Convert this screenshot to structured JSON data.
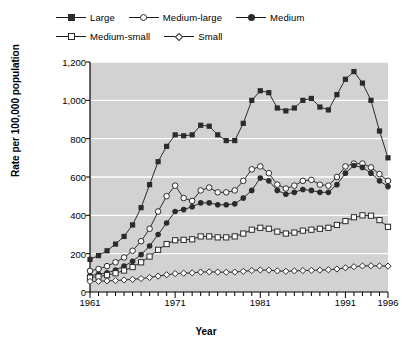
{
  "chart_data": {
    "type": "line",
    "title": "",
    "subtitle": "",
    "xlabel": "Year",
    "ylabel": "Rate per 100,000 population",
    "xlim": [
      1961,
      1996
    ],
    "ylim": [
      0,
      1200
    ],
    "yticks": [
      0,
      200,
      400,
      600,
      800,
      1000,
      1200
    ],
    "ytick_labels": [
      "0",
      "200",
      "400",
      "600",
      "800",
      "1,000",
      "1,200"
    ],
    "xticks": [
      1961,
      1971,
      1981,
      1991,
      1996
    ],
    "xtick_labels": [
      "1961",
      "1971",
      "1981",
      "1991",
      "1996"
    ],
    "x_minor_tick_interval": 1,
    "grid": "horizontal-white-on-gray",
    "plot_background": "#d2d2d2",
    "legend_position": "above-plot",
    "x": [
      1961,
      1962,
      1963,
      1964,
      1965,
      1966,
      1967,
      1968,
      1969,
      1970,
      1971,
      1972,
      1973,
      1974,
      1975,
      1976,
      1977,
      1978,
      1979,
      1980,
      1981,
      1982,
      1983,
      1984,
      1985,
      1986,
      1987,
      1988,
      1989,
      1990,
      1991,
      1992,
      1993,
      1994,
      1995,
      1996
    ],
    "series": [
      {
        "name": "Large",
        "marker": "filled-square",
        "color": "#2b2b2b",
        "values": [
          170,
          190,
          215,
          250,
          290,
          350,
          440,
          560,
          680,
          760,
          820,
          815,
          820,
          870,
          865,
          820,
          790,
          790,
          880,
          1000,
          1050,
          1040,
          960,
          945,
          960,
          1000,
          1010,
          965,
          950,
          1030,
          1110,
          1150,
          1090,
          1000,
          840,
          700
        ]
      },
      {
        "name": "Medium-large",
        "marker": "open-circle",
        "color": "#2b2b2b",
        "values": [
          110,
          120,
          135,
          155,
          180,
          215,
          265,
          330,
          420,
          500,
          555,
          490,
          475,
          530,
          545,
          520,
          520,
          530,
          580,
          640,
          655,
          620,
          560,
          540,
          555,
          580,
          585,
          560,
          555,
          600,
          655,
          670,
          670,
          650,
          615,
          580
        ]
      },
      {
        "name": "Medium",
        "marker": "filled-circle",
        "color": "#2b2b2b",
        "values": [
          85,
          92,
          100,
          115,
          135,
          160,
          195,
          240,
          300,
          360,
          420,
          430,
          445,
          465,
          465,
          455,
          455,
          460,
          490,
          530,
          595,
          580,
          530,
          510,
          520,
          535,
          530,
          520,
          520,
          560,
          620,
          660,
          650,
          620,
          580,
          550
        ]
      },
      {
        "name": "Medium-small",
        "marker": "open-square",
        "color": "#2b2b2b",
        "values": [
          75,
          80,
          88,
          98,
          112,
          130,
          155,
          185,
          220,
          250,
          270,
          272,
          275,
          290,
          290,
          285,
          285,
          290,
          305,
          325,
          335,
          330,
          315,
          305,
          310,
          320,
          325,
          330,
          335,
          350,
          370,
          390,
          400,
          398,
          375,
          340
        ]
      },
      {
        "name": "Small",
        "marker": "open-diamond",
        "color": "#2b2b2b",
        "values": [
          55,
          56,
          58,
          60,
          63,
          66,
          70,
          76,
          83,
          90,
          96,
          98,
          100,
          104,
          105,
          104,
          103,
          104,
          108,
          112,
          115,
          114,
          110,
          108,
          110,
          112,
          113,
          114,
          116,
          120,
          126,
          132,
          136,
          137,
          136,
          135
        ]
      }
    ]
  },
  "legend": {
    "rows": [
      [
        {
          "label": "Large",
          "marker": "filled-square"
        },
        {
          "label": "Medium-large",
          "marker": "open-circle"
        },
        {
          "label": "Medium",
          "marker": "filled-circle"
        }
      ],
      [
        {
          "label": "Medium-small",
          "marker": "open-square"
        },
        {
          "label": "Small",
          "marker": "open-diamond"
        }
      ]
    ]
  }
}
